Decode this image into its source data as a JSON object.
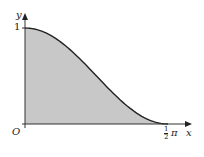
{
  "chart_data": {
    "type": "area",
    "title": "",
    "xlabel": "x",
    "ylabel": "y",
    "function_shape": "y = cos^2 x (shaded region under curve)",
    "x": [
      0,
      0.1963,
      0.3927,
      0.589,
      0.7854,
      0.9817,
      1.1781,
      1.3744,
      1.5708
    ],
    "y": [
      1,
      0.962,
      0.854,
      0.691,
      0.5,
      0.309,
      0.146,
      0.038,
      0
    ],
    "xlim": [
      0,
      1.75
    ],
    "ylim": [
      0,
      1.15
    ],
    "x_ticks": [
      {
        "value": 1.5708,
        "label": "½π"
      }
    ],
    "y_ticks": [
      {
        "value": 1,
        "label": "1"
      }
    ],
    "origin_label": "O",
    "shaded": true,
    "fill_color": "#c8c8c8",
    "curve_color": "#222222",
    "grid": false,
    "legend": null
  },
  "labels": {
    "origin": "O",
    "x_axis": "x",
    "y_axis": "y",
    "y_tick": "1",
    "x_tick_num": "1",
    "x_tick_den": "2",
    "x_tick_pi": "π"
  }
}
